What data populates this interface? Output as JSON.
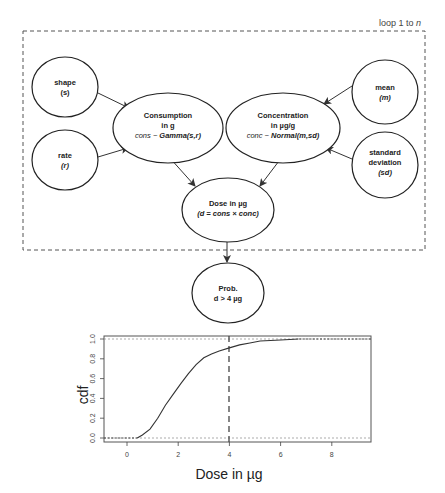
{
  "diagram": {
    "loop_label": "loop 1 to ",
    "loop_var": "n",
    "nodes": {
      "shape": {
        "line1": "shape",
        "line2": "(s)"
      },
      "rate": {
        "line1": "rate",
        "line2": "(r)"
      },
      "consumption": {
        "line1": "Consumption",
        "line2": "in g",
        "line3_a": "cons ~ ",
        "line3_b": "Gamma(s,r)"
      },
      "concentration": {
        "line1": "Concentration",
        "line2": "in µg/g",
        "line3_a": "conc ~ ",
        "line3_b": "Normal(m,sd)"
      },
      "mean": {
        "line1": "mean",
        "line2": "(m)"
      },
      "std_dev": {
        "line1": "standard",
        "line2": "deviation",
        "line3": "(sd)"
      },
      "dose": {
        "line1": "Dose in µg",
        "line2": "(d = cons × conc)"
      },
      "prob": {
        "line1": "Prob.",
        "line2": "d > 4 µg"
      }
    },
    "edges": [
      [
        "shape",
        "consumption"
      ],
      [
        "rate",
        "consumption"
      ],
      [
        "mean",
        "concentration"
      ],
      [
        "std_dev",
        "concentration"
      ],
      [
        "consumption",
        "dose"
      ],
      [
        "concentration",
        "dose"
      ],
      [
        "dose",
        "prob"
      ]
    ]
  },
  "chart_data": {
    "type": "line",
    "title": "",
    "xlabel": "Dose in µg",
    "ylabel": "cdf",
    "xlim": [
      -0.8,
      9.5
    ],
    "ylim": [
      -0.04,
      1.04
    ],
    "xticks": [
      0,
      2,
      4,
      6,
      8
    ],
    "yticks": [
      0.0,
      0.2,
      0.4,
      0.6,
      0.8,
      1.0
    ],
    "xtick_labels": [
      "0",
      "2",
      "4",
      "6",
      "8"
    ],
    "ytick_labels": [
      "0.0",
      "0.2",
      "0.4",
      "0.6",
      "0.8",
      "1.0"
    ],
    "reference_lines": {
      "horizontal_dotted": [
        0.0,
        1.0
      ],
      "vertical_dashed": 4
    },
    "series": [
      {
        "name": "empirical cdf of dose",
        "x": [
          0.4,
          0.6,
          0.9,
          1.2,
          1.5,
          1.8,
          2.1,
          2.4,
          2.7,
          3.0,
          3.3,
          3.6,
          4.0,
          4.4,
          4.8,
          5.2,
          5.6,
          6.0,
          6.7
        ],
        "y": [
          0.0,
          0.03,
          0.09,
          0.2,
          0.33,
          0.44,
          0.55,
          0.65,
          0.74,
          0.81,
          0.85,
          0.88,
          0.91,
          0.94,
          0.96,
          0.98,
          0.985,
          0.99,
          1.0
        ]
      }
    ]
  }
}
